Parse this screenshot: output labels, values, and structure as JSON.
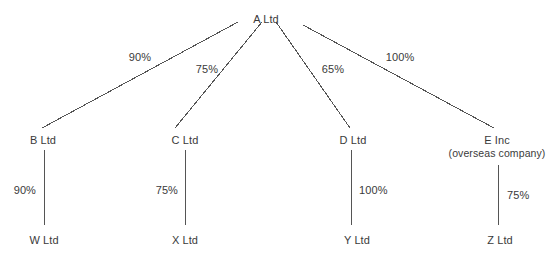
{
  "diagram": {
    "type": "organisational-ownership-tree",
    "title": "",
    "background_color": "#ffffff",
    "line_color": "#555555",
    "text_color": "#3a3a3a",
    "nodes": [
      {
        "id": "A",
        "label": "A Ltd",
        "sub": "",
        "x": 266,
        "y": 13,
        "level": 0
      },
      {
        "id": "B",
        "label": "B Ltd",
        "sub": "",
        "x": 43,
        "y": 134,
        "level": 1
      },
      {
        "id": "C",
        "label": "C Ltd",
        "sub": "",
        "x": 185,
        "y": 134,
        "level": 1
      },
      {
        "id": "D",
        "label": "D Ltd",
        "sub": "",
        "x": 353,
        "y": 134,
        "level": 1
      },
      {
        "id": "E",
        "label": "E Inc",
        "sub": "(overseas company)",
        "x": 497,
        "y": 134,
        "level": 1
      },
      {
        "id": "W",
        "label": "W Ltd",
        "sub": "",
        "x": 44,
        "y": 234,
        "level": 2
      },
      {
        "id": "X",
        "label": "X Ltd",
        "sub": "",
        "x": 185,
        "y": 234,
        "level": 2
      },
      {
        "id": "Y",
        "label": "Y Ltd",
        "sub": "",
        "x": 357,
        "y": 234,
        "level": 2
      },
      {
        "id": "Z",
        "label": "Z Ltd",
        "sub": "",
        "x": 500,
        "y": 234,
        "level": 2
      }
    ],
    "edges": [
      {
        "id": "A-B",
        "from": "A",
        "to": "B",
        "label": "90%",
        "x1": 238,
        "y1": 22,
        "x2": 42,
        "y2": 128,
        "label_x": 140,
        "label_y": 51,
        "label_anchor": "center"
      },
      {
        "id": "A-C",
        "from": "A",
        "to": "C",
        "label": "75%",
        "x1": 262,
        "y1": 22,
        "x2": 175,
        "y2": 128,
        "label_x": 207,
        "label_y": 63,
        "label_anchor": "center"
      },
      {
        "id": "A-D",
        "from": "A",
        "to": "D",
        "label": "65%",
        "x1": 276,
        "y1": 22,
        "x2": 350,
        "y2": 128,
        "label_x": 333,
        "label_y": 63,
        "label_anchor": "center"
      },
      {
        "id": "A-E",
        "from": "A",
        "to": "E",
        "label": "100%",
        "x1": 303,
        "y1": 25,
        "x2": 494,
        "y2": 128,
        "label_x": 400,
        "label_y": 51,
        "label_anchor": "center"
      },
      {
        "id": "B-W",
        "from": "B",
        "to": "W",
        "label": "90%",
        "x1": 44,
        "y1": 150,
        "x2": 44,
        "y2": 225,
        "label_x": 36,
        "label_y": 184,
        "label_anchor": "right"
      },
      {
        "id": "C-X",
        "from": "C",
        "to": "X",
        "label": "75%",
        "x1": 185,
        "y1": 150,
        "x2": 185,
        "y2": 225,
        "label_x": 178,
        "label_y": 184,
        "label_anchor": "right"
      },
      {
        "id": "D-Y",
        "from": "D",
        "to": "Y",
        "label": "100%",
        "x1": 351,
        "y1": 150,
        "x2": 351,
        "y2": 225,
        "label_x": 359,
        "label_y": 184,
        "label_anchor": "left"
      },
      {
        "id": "E-Z",
        "from": "E",
        "to": "Z",
        "label": "75%",
        "x1": 498,
        "y1": 165,
        "x2": 498,
        "y2": 225,
        "label_x": 507,
        "label_y": 189,
        "label_anchor": "left"
      }
    ]
  }
}
